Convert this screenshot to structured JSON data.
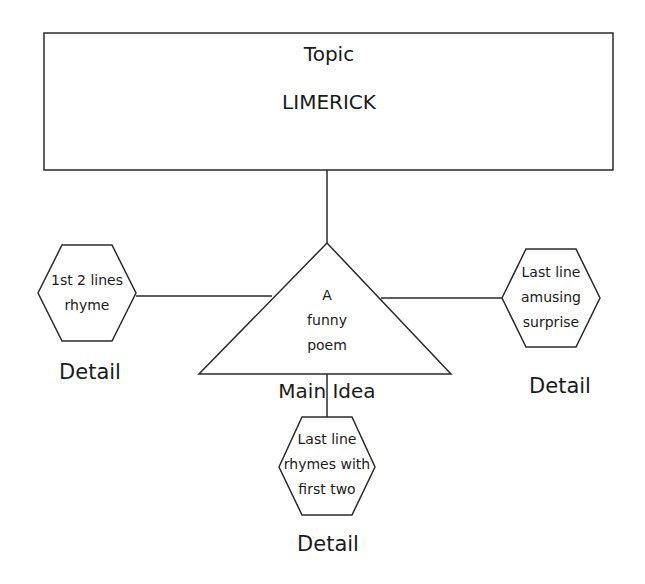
{
  "topic": {
    "title": "Topic",
    "value": "LIMERICK"
  },
  "main_idea": {
    "label": "Main Idea",
    "text_lines": [
      "A",
      "funny",
      "poem"
    ]
  },
  "details": [
    {
      "position": "left",
      "text_lines": [
        "1st 2 lines",
        "rhyme"
      ],
      "label": "Detail"
    },
    {
      "position": "right",
      "text_lines": [
        "Last line",
        "amusing",
        "surprise"
      ],
      "label": "Detail"
    },
    {
      "position": "bottom",
      "text_lines": [
        "Last line",
        "rhymes with",
        "first two"
      ],
      "label": "Detail"
    }
  ],
  "colors": {
    "stroke": "#2a2a2a",
    "background": "#ffffff",
    "text": "#1a1a1a"
  }
}
